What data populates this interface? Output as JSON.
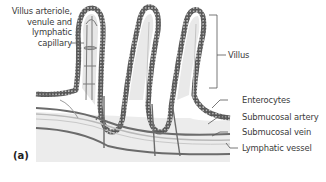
{
  "figure": {
    "panel_label": "(a)"
  },
  "labels": {
    "villus_vessels": [
      "Villus arteriole,",
      "venule and",
      "lymphatic",
      "capillary"
    ],
    "villus": "Villus",
    "enterocytes": "Enterocytes",
    "submucosal_artery": "Submucosal artery",
    "submucosal_vein": "Submucosal  vein",
    "lymphatic_vessel": "Lymphatic vessel"
  },
  "colors": {
    "cell_outline": "#555555",
    "cell_fill": "#bdbdbd",
    "villus_core": "#e6e6e6",
    "tissue_bg": "#ececec",
    "vessel_dark": "#6b6b6b",
    "vessel_light": "#b9b9b9",
    "leader_line": "#555555",
    "text": "#3a3a3a"
  }
}
